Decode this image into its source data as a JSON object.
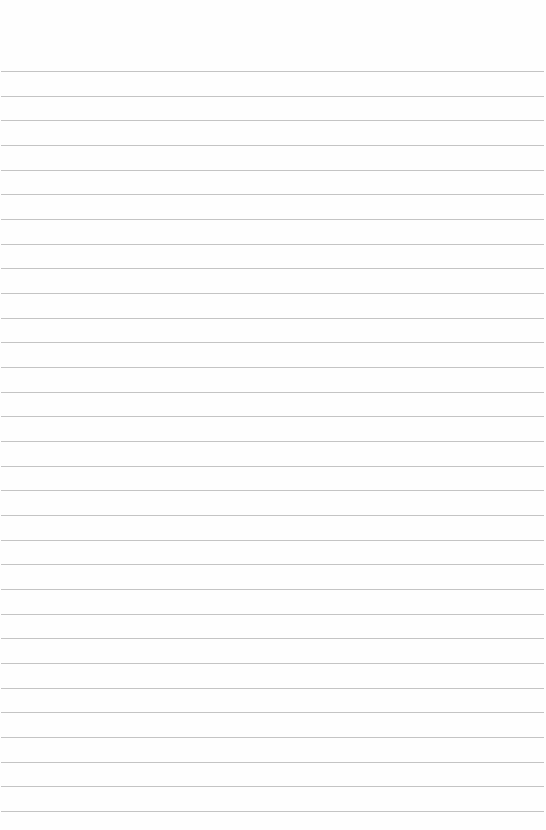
{
  "page": {
    "type": "lined-paper",
    "background": "#fefefe",
    "rule_color": "#c4c4c4",
    "rule_count": 31,
    "first_rule_y": 71,
    "rule_spacing": 24.67,
    "rule_left": 1,
    "rule_width": 543,
    "text": ""
  }
}
